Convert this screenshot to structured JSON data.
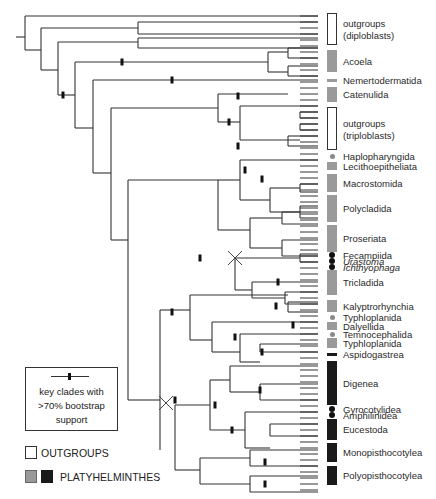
{
  "figure": {
    "line_color": "#333333",
    "bootstrap_mark_color": "#111111",
    "colors": {
      "outgroup": "#ffffff",
      "platy_gray": "#9a9a9a",
      "platy_black": "#1a1a1a"
    }
  },
  "clades": [
    {
      "label": "outgroups",
      "label2": "(diploblasts)",
      "type": "out",
      "y0": 13,
      "y1": 45
    },
    {
      "label": "Acoela",
      "type": "gray",
      "y0": 50,
      "y1": 72
    },
    {
      "label": "Nemertodermatida",
      "type": "gray",
      "y0": 79,
      "y1": 81
    },
    {
      "label": "Catenulida",
      "type": "gray",
      "y0": 87,
      "y1": 102
    },
    {
      "label": "outgroups",
      "label2": "(triploblasts)",
      "type": "out",
      "y0": 107,
      "y1": 150
    },
    {
      "label": "Haplopharyngida",
      "type": "dot",
      "y0": 155,
      "y1": 157
    },
    {
      "label": "Lecithoepitheliata",
      "type": "gray",
      "y0": 162,
      "y1": 170
    },
    {
      "label": "Macrostomida",
      "type": "gray",
      "y0": 174,
      "y1": 192
    },
    {
      "label": "Polycladida",
      "type": "gray",
      "y0": 195,
      "y1": 222
    },
    {
      "label": "Proseriata",
      "type": "gray",
      "y0": 225,
      "y1": 252
    },
    {
      "label": "Fecampiida",
      "type": "bdot",
      "y0": 254,
      "y1": 256
    },
    {
      "label": "Urastoma",
      "type": "bdot",
      "italic": true,
      "y0": 260,
      "y1": 262
    },
    {
      "label": "Ichthyophaga",
      "type": "bdot",
      "italic": true,
      "y0": 266,
      "y1": 268
    },
    {
      "label": "Tricladida",
      "type": "gray",
      "y0": 270,
      "y1": 295
    },
    {
      "label": "Kalyptrorhynchia",
      "type": "gray",
      "y0": 300,
      "y1": 312
    },
    {
      "label": "Typhloplanida",
      "type": "dot",
      "y0": 316,
      "y1": 318
    },
    {
      "label": "Dalyellida",
      "type": "gray",
      "y0": 322,
      "y1": 330
    },
    {
      "label": "Temnocephalida",
      "type": "dot",
      "y0": 333,
      "y1": 335
    },
    {
      "label": "Typhloplanida",
      "type": "gray",
      "y0": 338,
      "y1": 348
    },
    {
      "label": "Aspidogastrea",
      "type": "black",
      "y0": 353,
      "y1": 356
    },
    {
      "label": "Digenea",
      "type": "black",
      "y0": 361,
      "y1": 405
    },
    {
      "label": "Gyrocotylidea",
      "type": "bdot",
      "y0": 408,
      "y1": 410
    },
    {
      "label": "Amphilinidea",
      "type": "bdot",
      "y0": 414,
      "y1": 416
    },
    {
      "label": "Eucestoda",
      "type": "black",
      "y0": 419,
      "y1": 440
    },
    {
      "label": "Monopisthocotylea",
      "type": "black",
      "y0": 443,
      "y1": 462
    },
    {
      "label": "Polyopisthocotylea",
      "type": "black",
      "y0": 466,
      "y1": 485
    }
  ],
  "legend": {
    "key_text_1": "key clades with",
    "key_text_2": ">70% bootstrap",
    "key_text_3": "support",
    "outgroups_label": "OUTGROUPS",
    "platyhelminthes_label": "PLATYHELMINTHES"
  },
  "tree": {
    "segments": [
      [
        16,
        37,
        25,
        37
      ],
      [
        25,
        16,
        25,
        50
      ],
      [
        25,
        16,
        318,
        16
      ],
      [
        25,
        50,
        41,
        50
      ],
      [
        41,
        28,
        41,
        70
      ],
      [
        41,
        28,
        138,
        28
      ],
      [
        41,
        70,
        58,
        70
      ],
      [
        58,
        42,
        58,
        95
      ],
      [
        58,
        42,
        138,
        42
      ],
      [
        58,
        95,
        75,
        95
      ],
      [
        75,
        62,
        75,
        128
      ],
      [
        75,
        62,
        268,
        62
      ],
      [
        75,
        128,
        93,
        128
      ],
      [
        93,
        80,
        93,
        173
      ],
      [
        93,
        80,
        318,
        80
      ],
      [
        93,
        173,
        111,
        173
      ],
      [
        111,
        108,
        111,
        240
      ],
      [
        111,
        108,
        218,
        108
      ],
      [
        111,
        240,
        128,
        240
      ],
      [
        128,
        180,
        128,
        400
      ],
      [
        128,
        180,
        218,
        180
      ],
      [
        128,
        400,
        160,
        400
      ],
      [
        160,
        355,
        160,
        450
      ],
      [
        218,
        94,
        218,
        122
      ],
      [
        218,
        94,
        288,
        94
      ],
      [
        218,
        122,
        240,
        122
      ],
      [
        240,
        106,
        240,
        140
      ],
      [
        240,
        106,
        318,
        106
      ],
      [
        240,
        140,
        300,
        140
      ],
      [
        138,
        22,
        138,
        34
      ],
      [
        138,
        22,
        318,
        22
      ],
      [
        138,
        34,
        318,
        34
      ],
      [
        138,
        38,
        138,
        48
      ],
      [
        138,
        38,
        318,
        38
      ],
      [
        138,
        48,
        318,
        48
      ],
      [
        268,
        52,
        268,
        72
      ],
      [
        268,
        52,
        288,
        52
      ],
      [
        268,
        72,
        288,
        72
      ],
      [
        288,
        48,
        288,
        58
      ],
      [
        288,
        48,
        318,
        48
      ],
      [
        288,
        58,
        318,
        58
      ],
      [
        288,
        66,
        288,
        76
      ],
      [
        288,
        66,
        318,
        66
      ],
      [
        288,
        76,
        318,
        76
      ],
      [
        218,
        96,
        218,
        96
      ],
      [
        300,
        112,
        300,
        118
      ],
      [
        300,
        112,
        318,
        112
      ],
      [
        300,
        118,
        318,
        118
      ],
      [
        288,
        136,
        288,
        146
      ],
      [
        288,
        136,
        318,
        136
      ],
      [
        288,
        146,
        318,
        146
      ],
      [
        300,
        124,
        300,
        130
      ],
      [
        300,
        124,
        318,
        124
      ],
      [
        300,
        130,
        318,
        130
      ],
      [
        218,
        180,
        218,
        230
      ],
      [
        218,
        180,
        240,
        180
      ],
      [
        218,
        230,
        250,
        230
      ],
      [
        240,
        160,
        240,
        200
      ],
      [
        240,
        160,
        318,
        160
      ],
      [
        240,
        200,
        270,
        200
      ],
      [
        270,
        188,
        270,
        212
      ],
      [
        270,
        188,
        300,
        188
      ],
      [
        270,
        212,
        300,
        212
      ],
      [
        300,
        184,
        300,
        192
      ],
      [
        300,
        184,
        318,
        184
      ],
      [
        300,
        192,
        318,
        192
      ],
      [
        300,
        206,
        300,
        218
      ],
      [
        300,
        206,
        318,
        206
      ],
      [
        300,
        218,
        318,
        218
      ],
      [
        250,
        218,
        250,
        248
      ],
      [
        250,
        218,
        282,
        218
      ],
      [
        250,
        248,
        282,
        248
      ],
      [
        282,
        212,
        282,
        224
      ],
      [
        282,
        212,
        318,
        212
      ],
      [
        282,
        224,
        318,
        224
      ],
      [
        282,
        240,
        282,
        256
      ],
      [
        282,
        240,
        318,
        240
      ],
      [
        282,
        256,
        318,
        256
      ],
      [
        235,
        258,
        235,
        290
      ],
      [
        235,
        258,
        300,
        258
      ],
      [
        235,
        290,
        252,
        290
      ],
      [
        300,
        254,
        300,
        262
      ],
      [
        300,
        254,
        318,
        254
      ],
      [
        300,
        262,
        318,
        262
      ],
      [
        252,
        282,
        252,
        298
      ],
      [
        252,
        282,
        318,
        282
      ],
      [
        252,
        298,
        285,
        298
      ],
      [
        285,
        292,
        285,
        304
      ],
      [
        285,
        292,
        318,
        292
      ],
      [
        285,
        304,
        318,
        304
      ],
      [
        160,
        310,
        160,
        355
      ],
      [
        160,
        310,
        190,
        310
      ],
      [
        190,
        295,
        190,
        340
      ],
      [
        190,
        295,
        288,
        295
      ],
      [
        190,
        340,
        212,
        340
      ],
      [
        288,
        302,
        288,
        312
      ],
      [
        288,
        302,
        318,
        302
      ],
      [
        288,
        312,
        318,
        312
      ],
      [
        212,
        322,
        212,
        352
      ],
      [
        212,
        322,
        318,
        322
      ],
      [
        212,
        352,
        240,
        352
      ],
      [
        240,
        334,
        240,
        362
      ],
      [
        240,
        334,
        318,
        334
      ],
      [
        240,
        362,
        260,
        362
      ],
      [
        260,
        344,
        260,
        352
      ],
      [
        260,
        344,
        318,
        344
      ],
      [
        260,
        352,
        318,
        352
      ],
      [
        175,
        405,
        175,
        470
      ],
      [
        175,
        405,
        210,
        405
      ],
      [
        175,
        470,
        200,
        470
      ],
      [
        210,
        380,
        210,
        430
      ],
      [
        210,
        380,
        230,
        380
      ],
      [
        210,
        430,
        245,
        430
      ],
      [
        230,
        366,
        230,
        392
      ],
      [
        230,
        366,
        318,
        366
      ],
      [
        230,
        392,
        260,
        392
      ],
      [
        260,
        384,
        260,
        400
      ],
      [
        260,
        384,
        318,
        384
      ],
      [
        260,
        400,
        318,
        400
      ],
      [
        245,
        412,
        245,
        448
      ],
      [
        245,
        412,
        318,
        412
      ],
      [
        245,
        448,
        270,
        448
      ],
      [
        270,
        424,
        270,
        436
      ],
      [
        270,
        424,
        318,
        424
      ],
      [
        270,
        436,
        318,
        436
      ],
      [
        200,
        458,
        200,
        484
      ],
      [
        200,
        458,
        250,
        458
      ],
      [
        200,
        484,
        250,
        484
      ],
      [
        250,
        450,
        250,
        466
      ],
      [
        250,
        450,
        318,
        450
      ],
      [
        250,
        466,
        318,
        466
      ],
      [
        250,
        476,
        250,
        492
      ],
      [
        250,
        476,
        318,
        476
      ],
      [
        250,
        492,
        318,
        492
      ]
    ],
    "bootstrap_marks": [
      [
        63,
        95
      ],
      [
        122,
        62
      ],
      [
        172,
        80
      ],
      [
        229,
        122
      ],
      [
        238,
        96
      ],
      [
        238,
        146
      ],
      [
        245,
        170
      ],
      [
        262,
        179
      ],
      [
        276,
        306
      ],
      [
        262,
        352
      ],
      [
        235,
        337
      ],
      [
        172,
        312
      ],
      [
        175,
        400
      ],
      [
        215,
        405
      ],
      [
        260,
        390
      ],
      [
        265,
        462
      ],
      [
        265,
        484
      ],
      [
        200,
        258
      ],
      [
        278,
        282
      ],
      [
        293,
        325
      ],
      [
        232,
        430
      ]
    ],
    "x_marks": [
      [
        235,
        258
      ],
      [
        166,
        403
      ]
    ]
  }
}
